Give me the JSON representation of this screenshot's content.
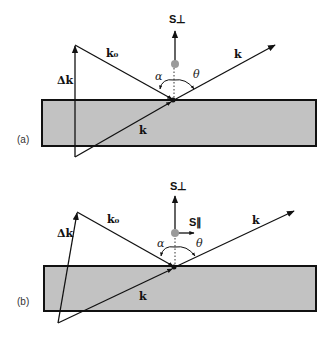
{
  "figure": {
    "panels": [
      {
        "id": "a",
        "label": "(a)",
        "vectors": {
          "k0": "k₀",
          "k_out": "k",
          "k_in": "k",
          "delta_k": "Δk",
          "s_perp": "S⊥"
        },
        "angles": {
          "alpha": "α",
          "theta": "θ"
        }
      },
      {
        "id": "b",
        "label": "(b)",
        "vectors": {
          "k0": "k₀",
          "k_out": "k",
          "k_in": "k",
          "delta_k": "Δk",
          "s_perp": "S⊥",
          "s_par": "S∥"
        },
        "angles": {
          "alpha": "α",
          "theta": "θ"
        }
      }
    ],
    "colors": {
      "slab_fill": "#c2c2c2",
      "stroke": "#111111",
      "dot": "#9a9a9a"
    }
  }
}
